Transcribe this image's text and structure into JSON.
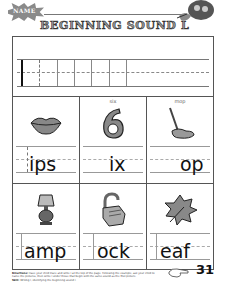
{
  "header": {
    "name_label": "NAME",
    "title": "BEGINNING SOUND L"
  },
  "trace_row": {
    "letter": "l",
    "trace_count": 6
  },
  "cells": [
    {
      "caption": "",
      "picture": "lips-icon",
      "word_ending": "ips",
      "letter_hint": "dashed"
    },
    {
      "caption": "six",
      "picture": "six-icon",
      "word_ending": "ix",
      "letter_hint": "none"
    },
    {
      "caption": "mop",
      "picture": "mop-icon",
      "word_ending": "op",
      "letter_hint": "none"
    },
    {
      "caption": "",
      "picture": "lamp-icon",
      "word_ending": "amp",
      "letter_hint": "solid"
    },
    {
      "caption": "",
      "picture": "lock-icon",
      "word_ending": "ock",
      "letter_hint": "solid"
    },
    {
      "caption": "",
      "picture": "leaf-icon",
      "word_ending": "eaf",
      "letter_hint": "solid"
    }
  ],
  "footer": {
    "directions_label": "Directions:",
    "directions_text": "Have your child trace and write l at the top of the page. Following the example, ask your child to name the pictures, then write l under those that begin with the same sound as the first picture.",
    "skill_label": "Skill:",
    "skill_text": "Writing l, identifying the beginning sound l.",
    "page_number": "31"
  }
}
